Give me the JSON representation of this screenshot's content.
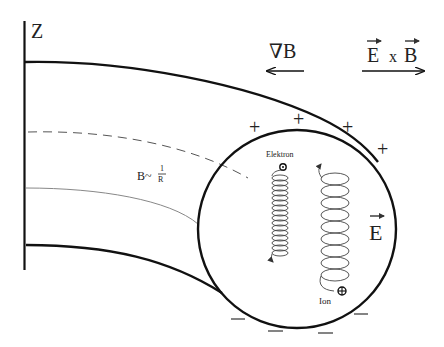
{
  "diagram": {
    "axis_label": "Z",
    "gradient_label": "∇B",
    "gradient_direction": "left",
    "drift_label_E": "E",
    "drift_label_x": "x",
    "drift_label_B": "B",
    "drift_direction": "right",
    "field_relation": {
      "prefix": "B~",
      "numerator": "1",
      "denominator": "R"
    },
    "electric_field_label": "E",
    "particles": {
      "electron_label": "Elektron",
      "ion_label": "Ion"
    },
    "charges": {
      "top_sign": "+",
      "bottom_sign": "—"
    },
    "colors": {
      "stroke": "#111111",
      "thin_line": "#888888",
      "text": "#222222",
      "background": "#ffffff"
    }
  }
}
